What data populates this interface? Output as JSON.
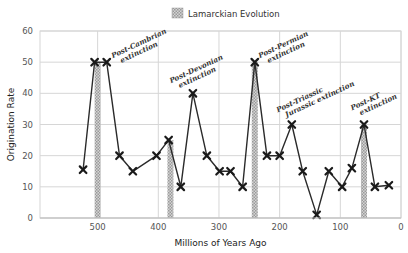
{
  "chart_data": {
    "type": "line",
    "title": "",
    "xlabel": "Millions of Years Ago",
    "ylabel": "Origination Rate",
    "xlim": [
      595,
      0
    ],
    "ylim": [
      0,
      60
    ],
    "x_reversed": true,
    "grid": true,
    "x_ticks": [
      500,
      400,
      300,
      200,
      100,
      0
    ],
    "y_ticks": [
      0,
      10,
      20,
      30,
      40,
      50,
      60
    ],
    "legend": {
      "position": "top-center",
      "entries": [
        "Lamarckian Evolution"
      ]
    },
    "series": [
      {
        "name": "Origination Rate",
        "type": "line",
        "marker": "x",
        "color": "#222222",
        "x": [
          524,
          505,
          485,
          464,
          442,
          403,
          383,
          363,
          343,
          320,
          299,
          281,
          261,
          241,
          221,
          200,
          180,
          162,
          139,
          119,
          97,
          81,
          61,
          43,
          20
        ],
        "values": [
          15.5,
          50,
          50,
          20,
          15,
          20,
          25,
          10,
          40,
          20,
          15,
          15,
          10,
          50,
          20,
          20,
          30,
          15,
          1,
          15,
          10,
          16,
          30,
          10,
          10.5
        ]
      },
      {
        "name": "Lamarckian Evolution",
        "type": "bar",
        "pattern": "hatched-gray",
        "color": "#b8b8b8",
        "x": [
          500,
          380,
          241,
          61
        ],
        "values": [
          50,
          25,
          50,
          30
        ]
      }
    ],
    "annotations": [
      {
        "text": [
          "Post-Cambrian",
          "extinction"
        ],
        "x": 485,
        "y": 50
      },
      {
        "text": [
          "Post-Devonian",
          "extinction"
        ],
        "x": 343,
        "y": 40
      },
      {
        "text": [
          "Post-Permian",
          "extinction"
        ],
        "x": 241,
        "y": 50
      },
      {
        "text": [
          "Post-Triassic",
          "Jurassic extinction"
        ],
        "x": 180,
        "y": 30
      },
      {
        "text": [
          "Post-KT",
          "extinction"
        ],
        "x": 61,
        "y": 30
      }
    ]
  }
}
